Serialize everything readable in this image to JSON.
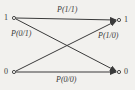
{
  "diagram": {
    "type": "binary-channel",
    "inputs": [
      {
        "id": "in-1",
        "label": "1"
      },
      {
        "id": "in-0",
        "label": "0"
      }
    ],
    "outputs": [
      {
        "id": "out-1",
        "label": "1"
      },
      {
        "id": "out-0",
        "label": "0"
      }
    ],
    "edges": [
      {
        "from": "1",
        "to": "1",
        "label": "P(1/1)"
      },
      {
        "from": "1",
        "to": "0",
        "label": "P(0/1)"
      },
      {
        "from": "0",
        "to": "1",
        "label": "P(1/0)"
      },
      {
        "from": "0",
        "to": "0",
        "label": "P(0/0)"
      }
    ],
    "colors": {
      "line": "#3a3a3a",
      "background": "#f2f1ee"
    }
  }
}
